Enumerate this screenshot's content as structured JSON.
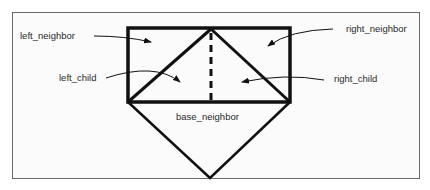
{
  "diagram": {
    "labels": {
      "left_neighbor": "left_neighbor",
      "right_neighbor": "right_neighbor",
      "left_child": "left_child",
      "right_child": "right_child",
      "base_neighbor": "base_neighbor"
    },
    "colors": {
      "stroke": "#111111",
      "frame": "#6a6a6a",
      "text": "#2a2a2a"
    }
  }
}
